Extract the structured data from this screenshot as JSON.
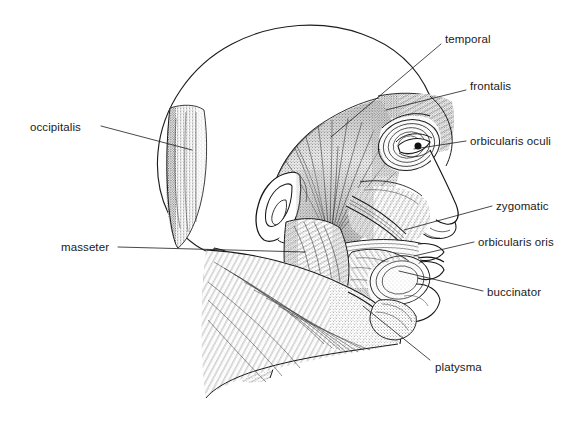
{
  "figure": {
    "style": "pen-and-ink stipple anatomical illustration",
    "background_color": "#ffffff",
    "ink_color": "#1a1a1a",
    "width": 588,
    "height": 445
  },
  "labels": [
    {
      "id": "temporal",
      "text": "temporal",
      "side": "right",
      "x": 445,
      "y": 33,
      "leader": {
        "x1": 441,
        "y1": 44,
        "x2": 331,
        "y2": 137
      }
    },
    {
      "id": "frontalis",
      "text": "frontalis",
      "side": "right",
      "x": 470,
      "y": 80,
      "leader": {
        "x1": 466,
        "y1": 90,
        "x2": 386,
        "y2": 110
      }
    },
    {
      "id": "orbicularis-oculi",
      "text": "orbicularis oculi",
      "side": "right",
      "x": 470,
      "y": 135,
      "leader": {
        "x1": 466,
        "y1": 141,
        "x2": 414,
        "y2": 149
      }
    },
    {
      "id": "zygomatic",
      "text": "zygomatic",
      "side": "right",
      "x": 496,
      "y": 200,
      "leader": {
        "x1": 492,
        "y1": 206,
        "x2": 404,
        "y2": 230
      }
    },
    {
      "id": "orbicularis-oris",
      "text": "orbicularis oris",
      "side": "right",
      "x": 478,
      "y": 236,
      "leader": {
        "x1": 474,
        "y1": 242,
        "x2": 414,
        "y2": 256
      }
    },
    {
      "id": "buccinator",
      "text": "buccinator",
      "side": "right",
      "x": 487,
      "y": 286,
      "leader": {
        "x1": 483,
        "y1": 291,
        "x2": 399,
        "y2": 271
      }
    },
    {
      "id": "platysma",
      "text": "platysma",
      "side": "right",
      "x": 435,
      "y": 361,
      "leader": {
        "x1": 430,
        "y1": 360,
        "x2": 363,
        "y2": 306
      }
    },
    {
      "id": "occipitalis",
      "text": "occipitalis",
      "side": "left",
      "x": 30,
      "y": 121,
      "leader": {
        "x1": 101,
        "y1": 126,
        "x2": 192,
        "y2": 150
      }
    },
    {
      "id": "masseter",
      "text": "masseter",
      "side": "left",
      "x": 61,
      "y": 241,
      "leader": {
        "x1": 118,
        "y1": 247,
        "x2": 305,
        "y2": 252
      }
    }
  ],
  "structures": [
    {
      "id": "cranial-vault-outline",
      "name": "cranial vault outline"
    },
    {
      "id": "occipitalis-muscle",
      "name": "occipitalis muscle belly"
    },
    {
      "id": "temporalis-muscle",
      "name": "temporalis fan-shaped muscle"
    },
    {
      "id": "frontalis-muscle",
      "name": "frontalis muscle"
    },
    {
      "id": "orbicularis-oculi-muscle",
      "name": "orbicularis oculi ring"
    },
    {
      "id": "eye",
      "name": "eye and eyelid"
    },
    {
      "id": "nose",
      "name": "nose profile"
    },
    {
      "id": "zygomatic-muscle",
      "name": "zygomatic muscle strap"
    },
    {
      "id": "orbicularis-oris-muscle",
      "name": "orbicularis oris ring"
    },
    {
      "id": "buccinator-muscle",
      "name": "buccinator muscle"
    },
    {
      "id": "masseter-muscle",
      "name": "masseter muscle"
    },
    {
      "id": "ear",
      "name": "external ear / auricle"
    },
    {
      "id": "platysma-muscle",
      "name": "platysma sheet over neck"
    },
    {
      "id": "sternocleidomastoid",
      "name": "sternocleidomastoid band"
    },
    {
      "id": "lips-chin",
      "name": "lips and chin profile"
    }
  ]
}
